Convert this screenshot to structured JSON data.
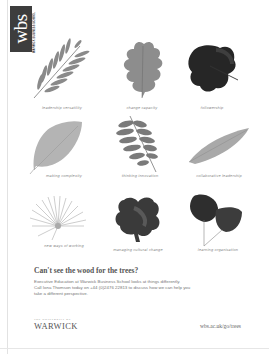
{
  "logo": {
    "mark": "wbs",
    "subtitle": "WARWICK BUSINESS SCHOOL",
    "block_color": "#3d3d3d"
  },
  "leaves": [
    {
      "icon": "ash-leaf-icon",
      "caption": "leadership versatility"
    },
    {
      "icon": "oak-leaf-icon",
      "caption": "change capacity"
    },
    {
      "icon": "vine-leaf-icon",
      "caption": "followership"
    },
    {
      "icon": "ovate-leaf-icon",
      "caption": "making complexity"
    },
    {
      "icon": "fern-leaf-icon",
      "caption": "thinking innovation"
    },
    {
      "icon": "lanceolate-leaf-icon",
      "caption": "collaborative leadership"
    },
    {
      "icon": "palm-leaf-icon",
      "caption": "new ways of working"
    },
    {
      "icon": "maple-leaf-icon",
      "caption": "managing cultural change"
    },
    {
      "icon": "heart-leaf-pair-icon",
      "caption": "learning organisation"
    }
  ],
  "headline": "Can't see the wood for the trees?",
  "body": {
    "line1": "Executive Education at Warwick Business School looks at things differently.",
    "line2": "Call Iona Thomson today on +44 (0)2476 22813 to discuss how we can help you",
    "line3": "take a different perspective."
  },
  "footer": {
    "university_prefix": "THE UNIVERSITY OF",
    "university_name": "WARWICK",
    "url": "wbs.ac.uk/go/trees"
  }
}
